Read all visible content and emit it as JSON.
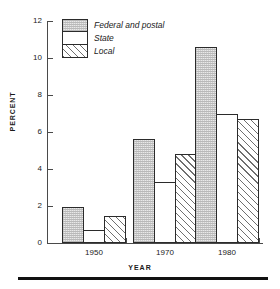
{
  "chart_data": {
    "type": "bar",
    "title": "",
    "subtitle": "",
    "xlabel": "YEAR",
    "ylabel": "PERCENT",
    "categories": [
      "1950",
      "1970",
      "1980"
    ],
    "series": [
      {
        "name": "Federal and postal",
        "values": [
          1.95,
          5.6,
          10.6
        ],
        "fill": "stipple"
      },
      {
        "name": "State",
        "values": [
          0.7,
          3.3,
          6.95
        ],
        "fill": "white"
      },
      {
        "name": "Local",
        "values": [
          1.45,
          4.8,
          6.7
        ],
        "fill": "diagonal-hatch"
      }
    ],
    "ylim": [
      0,
      12
    ],
    "yticks": [
      0,
      2,
      4,
      6,
      8,
      10,
      12
    ],
    "ytick_labels": [
      "0",
      "2",
      "4",
      "6",
      "8",
      "10",
      "12"
    ],
    "xtick_labels": [
      "1950",
      "1970",
      "1980"
    ],
    "grid": false,
    "legend_position": "top-left-inside",
    "legend_entries": [
      "Federal and postal",
      "State",
      "Local"
    ],
    "annotations": [],
    "colors": {
      "axis": "#4a4a4a",
      "bar_edge": "#2b2b2b",
      "stipple": "#e9e9e9",
      "hatch": "#6f6f6f",
      "background": "#ffffff",
      "rule": "#111111"
    }
  }
}
